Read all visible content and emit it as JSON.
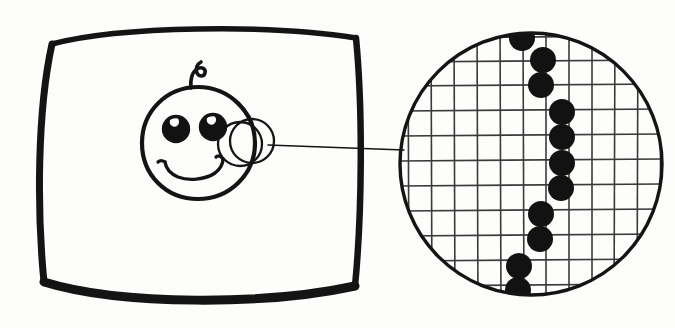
{
  "figure": {
    "type": "hand-drawn-diagram",
    "background_color": "#fdfdfc",
    "ink_color": "#141414",
    "grid_color": "#3a3a3a",
    "dot_color": "#121212",
    "canvas": {
      "width": 675,
      "height": 328
    }
  },
  "screen_panel": {
    "name": "screen-outline",
    "description": "Hand drawn rounded square representing a television or monitor screen",
    "stroke_width": 7,
    "bounds": {
      "x": 36,
      "y": 24,
      "width": 330,
      "height": 274
    }
  },
  "face": {
    "name": "smiley-face",
    "description": "Smiley face drawn on the screen with a single curl of hair",
    "head": {
      "cx": 198,
      "cy": 143,
      "r": 56,
      "stroke_width": 4
    },
    "hair_curl": {
      "description": "small question-mark shaped curl on top of head"
    },
    "eyes": [
      {
        "label": "left-eye",
        "cx": 176,
        "cy": 129,
        "r": 12.5
      },
      {
        "label": "right-eye",
        "cx": 213,
        "cy": 127,
        "r": 12.5
      }
    ],
    "mouth": {
      "label": "smile",
      "description": "upward arc with flicked ends"
    }
  },
  "magnifier": {
    "name": "magnifier-region",
    "description": "Small circle over the right cheek marking the region being magnified",
    "circles": [
      {
        "cx": 240,
        "cy": 143,
        "r": 22
      },
      {
        "cx": 251,
        "cy": 141,
        "r": 22
      }
    ],
    "stroke_width": 2.2
  },
  "connector": {
    "name": "connector-line",
    "description": "Thin leader line linking the magnifier region to the enlarged view",
    "x1": 266,
    "y1": 144,
    "x2": 404,
    "y2": 150,
    "stroke_width": 1.4
  },
  "magnified_view": {
    "name": "magnified-pixel-circle",
    "description": "Large circle showing the enlarged pixel grid with a staircase of filled pixels",
    "circle": {
      "cx": 531,
      "cy": 164,
      "r": 133,
      "stroke_width": 3.4
    },
    "grid": {
      "cell_size": 23,
      "line_width": 1.6,
      "vertical_lines": 12,
      "horizontal_lines": 12,
      "origin_x": 408,
      "origin_y": 38
    }
  },
  "chart_data": {
    "type": "scatter",
    "xlabel": "pixel column",
    "ylabel": "pixel row",
    "grid": true,
    "legend_position": "none",
    "xlim": [
      0,
      12
    ],
    "ylim": [
      0,
      12
    ],
    "series": [
      {
        "name": "filled-pixels",
        "marker": "filled-circle",
        "color": "#121212",
        "points": [
          {
            "col": 5,
            "row": 0,
            "cx": 522,
            "cy": 38,
            "r": 13
          },
          {
            "col": 6,
            "row": 1,
            "cx": 543,
            "cy": 60,
            "r": 13
          },
          {
            "col": 6,
            "row": 2,
            "cx": 541,
            "cy": 85,
            "r": 13
          },
          {
            "col": 7,
            "row": 3,
            "cx": 562,
            "cy": 112,
            "r": 13
          },
          {
            "col": 7,
            "row": 4,
            "cx": 562,
            "cy": 137,
            "r": 13
          },
          {
            "col": 7,
            "row": 5,
            "cx": 562,
            "cy": 163,
            "r": 13
          },
          {
            "col": 7,
            "row": 6,
            "cx": 561,
            "cy": 188,
            "r": 13
          },
          {
            "col": 6,
            "row": 7,
            "cx": 541,
            "cy": 214,
            "r": 13
          },
          {
            "col": 6,
            "row": 8,
            "cx": 540,
            "cy": 239,
            "r": 13
          },
          {
            "col": 5,
            "row": 9,
            "cx": 519,
            "cy": 266,
            "r": 13
          },
          {
            "col": 5,
            "row": 10,
            "cx": 518,
            "cy": 290,
            "r": 13
          }
        ]
      }
    ],
    "annotations": [
      "Filled pixels descend in a staircase from upper-left to lower-left",
      "Total filled pixels visible: 11"
    ]
  }
}
